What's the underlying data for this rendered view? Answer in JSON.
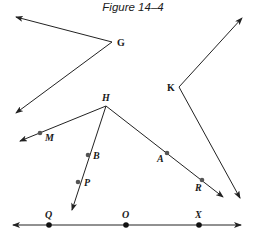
{
  "title": "Figure 14–4",
  "colors": {
    "line": "#222222",
    "point": "#555555",
    "dot": "#111111"
  },
  "labels": {
    "G": "G",
    "K": "K",
    "H": "H",
    "M": "M",
    "B": "B",
    "P": "P",
    "A": "A",
    "R": "R",
    "Q": "Q",
    "O": "O",
    "X": "X"
  },
  "figures": {
    "angle_G": {
      "vertex": [
        112,
        42
      ],
      "ray1_tip": [
        16,
        17
      ],
      "ray2_tip": [
        16,
        113
      ]
    },
    "angle_K": {
      "vertex": [
        179,
        87
      ],
      "ray1_tip": [
        242,
        18
      ],
      "ray2_tip": [
        240,
        198
      ]
    },
    "angle_H": {
      "vertex": [
        106,
        106
      ],
      "rays": [
        {
          "tip": [
            20,
            141
          ],
          "points": [
            "M"
          ]
        },
        {
          "tip": [
            72,
            210
          ],
          "points": [
            "B",
            "P"
          ]
        },
        {
          "tip": [
            223,
            197
          ],
          "points": [
            "A",
            "R"
          ]
        }
      ]
    },
    "line_QOX": {
      "from": [
        13,
        225
      ],
      "to": [
        241,
        225
      ],
      "points": [
        "Q",
        "O",
        "X"
      ]
    }
  },
  "points": {
    "M": [
      40,
      133
    ],
    "B": [
      88,
      155
    ],
    "P": [
      78,
      182
    ],
    "A": [
      167,
      153
    ],
    "R": [
      202,
      180
    ],
    "Q": [
      49,
      225
    ],
    "O": [
      126,
      225
    ],
    "X": [
      199,
      225
    ]
  }
}
